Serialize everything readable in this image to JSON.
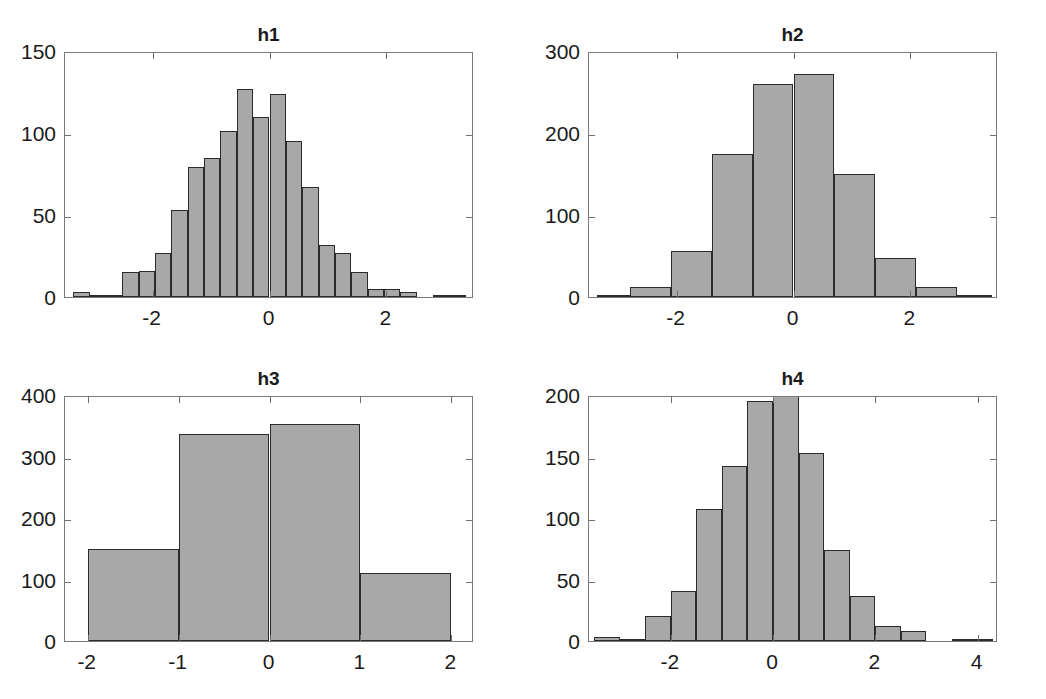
{
  "figure": {
    "width": 1046,
    "height": 699,
    "background": "#ffffff",
    "bar_fill": "#a8a8a8",
    "bar_edge": "#2b2b2b",
    "axis_color": "#7a7a7a",
    "text_color": "#1a1a1a"
  },
  "chart_data": [
    {
      "id": "h1",
      "type": "bar",
      "title": "h1",
      "xlabel": "",
      "ylabel": "",
      "grid": false,
      "legend": null,
      "xlim": [
        -3.5,
        3.5
      ],
      "ylim": [
        0,
        150
      ],
      "xticks": [
        -2,
        0,
        2
      ],
      "xtick_labels": [
        "-2",
        "0",
        "2"
      ],
      "yticks": [
        0,
        50,
        100,
        150
      ],
      "ytick_labels": [
        "0",
        "50",
        "100",
        "150"
      ],
      "bin_width": 0.28,
      "bin_edges": [
        -3.36,
        -3.08,
        -2.8,
        -2.52,
        -2.24,
        -1.96,
        -1.68,
        -1.4,
        -1.12,
        -0.84,
        -0.56,
        -0.28,
        0,
        0.28,
        0.56,
        0.84,
        1.12,
        1.4,
        1.68,
        1.96,
        2.24,
        2.52,
        2.8,
        3.08,
        3.36
      ],
      "categories": [
        "-3.36",
        "-3.08",
        "-2.80",
        "-2.52",
        "-2.24",
        "-1.96",
        "-1.68",
        "-1.40",
        "-1.12",
        "-0.84",
        "-0.56",
        "-0.28",
        "0.00",
        "0.28",
        "0.56",
        "0.84",
        "1.12",
        "1.40",
        "1.68",
        "1.96",
        "2.24",
        "2.52",
        "2.80",
        "3.08"
      ],
      "values": [
        3,
        1,
        1,
        15,
        16,
        27,
        53,
        79,
        85,
        101,
        127,
        110,
        124,
        95,
        67,
        32,
        27,
        15,
        5,
        5,
        3,
        0,
        1,
        1
      ]
    },
    {
      "id": "h2",
      "type": "bar",
      "title": "h2",
      "xlabel": "",
      "ylabel": "",
      "grid": false,
      "legend": null,
      "xlim": [
        -3.5,
        3.5
      ],
      "ylim": [
        0,
        300
      ],
      "xticks": [
        -2,
        0,
        2
      ],
      "xtick_labels": [
        "-2",
        "0",
        "2"
      ],
      "yticks": [
        0,
        100,
        200,
        300
      ],
      "ytick_labels": [
        "0",
        "100",
        "200",
        "300"
      ],
      "bin_width": 0.7,
      "bin_edges": [
        -3.36,
        -2.8,
        -2.1,
        -1.4,
        -0.7,
        0,
        0.7,
        1.4,
        2.1,
        2.8,
        3.4
      ],
      "categories": [
        "-3.36",
        "-2.80",
        "-2.10",
        "-1.40",
        "-0.70",
        "0.00",
        "0.70",
        "1.40",
        "2.10",
        "2.80"
      ],
      "values": [
        3,
        12,
        56,
        175,
        260,
        272,
        150,
        47,
        12,
        2
      ]
    },
    {
      "id": "h3",
      "type": "bar",
      "title": "h3",
      "xlabel": "",
      "ylabel": "",
      "grid": false,
      "legend": null,
      "xlim": [
        -2.25,
        2.25
      ],
      "ylim": [
        0,
        400
      ],
      "xticks": [
        -2,
        -1,
        0,
        1,
        2
      ],
      "xtick_labels": [
        "-2",
        "-1",
        "0",
        "1",
        "2"
      ],
      "yticks": [
        0,
        100,
        200,
        300,
        400
      ],
      "ytick_labels": [
        "0",
        "100",
        "200",
        "300",
        "400"
      ],
      "bin_width": 1,
      "bin_edges": [
        -2,
        -1,
        0,
        1,
        2
      ],
      "categories": [
        "-2",
        "-1",
        "0",
        "1"
      ],
      "values": [
        150,
        337,
        353,
        110
      ]
    },
    {
      "id": "h4",
      "type": "bar",
      "title": "h4",
      "xlabel": "",
      "ylabel": "",
      "grid": false,
      "legend": null,
      "xlim": [
        -3.6,
        4.4
      ],
      "ylim": [
        0,
        200
      ],
      "xticks": [
        -2,
        0,
        2,
        4
      ],
      "xtick_labels": [
        "-2",
        "0",
        "2",
        "4"
      ],
      "yticks": [
        0,
        50,
        100,
        150,
        200
      ],
      "ytick_labels": [
        "0",
        "50",
        "100",
        "150",
        "200"
      ],
      "bin_width": 0.5,
      "bin_edges": [
        -3.5,
        -3,
        -2.5,
        -2,
        -1.5,
        -1,
        -0.5,
        0,
        0.5,
        1,
        1.5,
        2,
        2.5,
        3,
        3.5,
        4,
        4.3
      ],
      "categories": [
        "-3.5",
        "-3.0",
        "-2.5",
        "-2.0",
        "-1.5",
        "-1.0",
        "-0.5",
        "0.0",
        "0.5",
        "1.0",
        "1.5",
        "2.0",
        "2.5",
        "3.0",
        "3.5",
        "4.0"
      ],
      "values": [
        3,
        1,
        20,
        41,
        107,
        142,
        195,
        205,
        153,
        74,
        37,
        12,
        8,
        0,
        2,
        1
      ]
    }
  ]
}
